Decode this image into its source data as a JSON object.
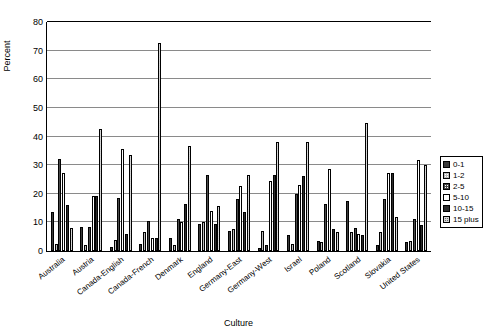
{
  "chart_data": {
    "type": "bar",
    "title": "",
    "xlabel": "Culture",
    "ylabel": "Percent",
    "ylim": [
      0,
      80
    ],
    "yticks": [
      0,
      10,
      20,
      30,
      40,
      50,
      60,
      70,
      80
    ],
    "grid": true,
    "legend_position": "right",
    "categories": [
      "Australia",
      "Austria",
      "Canada-English",
      "Canada-French",
      "Denmark",
      "England",
      "Germany-East",
      "Germany-West",
      "Israel",
      "Poland",
      "Scotland",
      "Slovakia",
      "United States"
    ],
    "series": [
      {
        "name": "0-1",
        "values": [
          13.5,
          8.5,
          1.5,
          2.5,
          4.5,
          9.5,
          7.0,
          1.0,
          5.5,
          3.5,
          17.5,
          2.0,
          3.0
        ]
      },
      {
        "name": "1-2",
        "values": [
          2.5,
          2.0,
          4.0,
          6.5,
          2.0,
          10.0,
          7.5,
          7.0,
          2.5,
          3.0,
          6.5,
          6.5,
          3.5
        ]
      },
      {
        "name": "2-5",
        "values": [
          32.0,
          8.5,
          18.5,
          10.5,
          11.0,
          26.5,
          18.0,
          2.0,
          20.0,
          16.5,
          8.0,
          18.0,
          11.0
        ]
      },
      {
        "name": "5-10",
        "values": [
          27.0,
          19.0,
          35.5,
          4.5,
          10.0,
          14.0,
          22.5,
          24.5,
          23.0,
          28.5,
          6.0,
          27.0,
          31.5
        ]
      },
      {
        "name": "10-15",
        "values": [
          16.0,
          19.0,
          6.0,
          4.5,
          16.5,
          9.5,
          13.5,
          26.5,
          26.0,
          7.5,
          5.5,
          27.0,
          9.0
        ]
      },
      {
        "name": "15 plus",
        "values": [
          8.0,
          42.5,
          33.5,
          72.5,
          36.5,
          15.5,
          26.5,
          38.0,
          38.0,
          6.5,
          44.5,
          12.0,
          30.0
        ]
      }
    ]
  },
  "legend": {
    "items": [
      {
        "label": "0-1"
      },
      {
        "label": "1-2"
      },
      {
        "label": "2-5"
      },
      {
        "label": "5-10"
      },
      {
        "label": "10-15"
      },
      {
        "label": "15 plus"
      }
    ]
  }
}
